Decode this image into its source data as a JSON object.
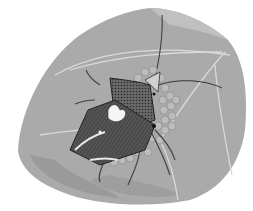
{
  "image": {
    "subject": "shield bug guarding egg cluster on a leaf",
    "style": "grayscale pencil illustration",
    "colors": {
      "background": "#ffffff",
      "leaf": "#a9a9a9",
      "leaf_light": "#c4c4c4",
      "leaf_shadow": "#8e8e8e",
      "bug_body": "#5a5a5a",
      "bug_dark": "#2e2e2e",
      "eggs": "#b8b8b8",
      "egg_highlight": "#dcdcdc",
      "veins": "#d8d8d8"
    }
  }
}
